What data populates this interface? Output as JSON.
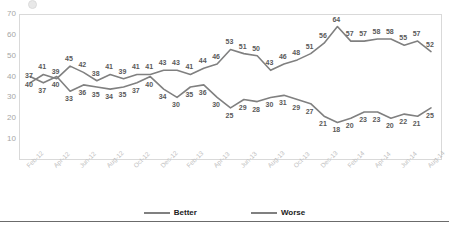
{
  "chart_data": {
    "type": "line",
    "title": "",
    "subtitle": "",
    "xlabel": "",
    "ylabel": "",
    "ylim": [
      0,
      70
    ],
    "ytick_labels": [
      "70",
      "60",
      "50",
      "40",
      "30",
      "20",
      "10"
    ],
    "ytick_values": [
      70,
      60,
      50,
      40,
      30,
      20,
      10
    ],
    "grid": false,
    "legend_position": "bottom",
    "x": [
      "Feb-12",
      "Mar-12",
      "Apr-12",
      "May-12",
      "Jun-12",
      "Jul-12",
      "Aug-12",
      "Sep-12",
      "Oct-12",
      "Nov-12",
      "Dec-12",
      "Jan-13",
      "Feb-13",
      "Mar-13",
      "Apr-13",
      "May-13",
      "Jun-13",
      "Jul-13",
      "Aug-13",
      "Sep-13",
      "Oct-13",
      "Nov-13",
      "Dec-13",
      "Jan-14",
      "Feb-14",
      "Mar-14",
      "Apr-14",
      "May-14",
      "Jun-14",
      "Jul-14",
      "Aug-14"
    ],
    "xtick_labels": [
      "Feb-12",
      "Apr-12",
      "Jun-12",
      "Aug-12",
      "Oct-12",
      "Dec-12",
      "Feb-13",
      "Apr-13",
      "Jun-13",
      "Aug-13",
      "Oct-13",
      "Dec-13",
      "Feb-14",
      "Apr-14",
      "Jun-14",
      "Aug-14"
    ],
    "series": [
      {
        "name": "Better",
        "color": "#808080",
        "values": [
          40,
          37,
          40,
          33,
          36,
          35,
          34,
          35,
          37,
          40,
          34,
          30,
          35,
          36,
          30,
          25,
          29,
          28,
          30,
          31,
          29,
          27,
          21,
          18,
          20,
          23,
          23,
          20,
          22,
          21,
          25
        ]
      },
      {
        "name": "Worse",
        "color": "#808080",
        "values": [
          37,
          41,
          39,
          45,
          42,
          38,
          41,
          39,
          41,
          41,
          43,
          43,
          41,
          44,
          46,
          53,
          51,
          50,
          43,
          46,
          48,
          51,
          56,
          64,
          57,
          57,
          58,
          58,
          55,
          57,
          52
        ]
      }
    ]
  },
  "legend": {
    "items": [
      {
        "label": "Better"
      },
      {
        "label": "Worse"
      }
    ]
  }
}
